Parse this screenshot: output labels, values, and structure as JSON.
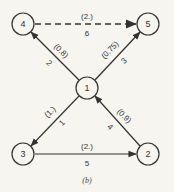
{
  "caption": "(b)",
  "nodes": [
    {
      "id": "1",
      "label": "1",
      "x": 87,
      "y": 88
    },
    {
      "id": "2",
      "label": "2",
      "x": 148,
      "y": 154
    },
    {
      "id": "3",
      "label": "3",
      "x": 23,
      "y": 154
    },
    {
      "id": "4",
      "label": "4",
      "x": 23,
      "y": 24
    },
    {
      "id": "5",
      "label": "5",
      "x": 148,
      "y": 24
    }
  ],
  "edges": [
    {
      "number": "1",
      "weight": "(1.)",
      "from": "1",
      "to": "3",
      "style": "solid"
    },
    {
      "number": "2",
      "weight": "(0.8)",
      "from": "1",
      "to": "4",
      "style": "solid"
    },
    {
      "number": "3",
      "weight": "(0.75)",
      "from": "1",
      "to": "5",
      "style": "solid"
    },
    {
      "number": "4",
      "weight": "(0.9)",
      "from": "2",
      "to": "1",
      "style": "solid"
    },
    {
      "number": "5",
      "weight": "(2.)",
      "from": "3",
      "to": "2",
      "style": "solid"
    },
    {
      "number": "6",
      "weight": "(2.)",
      "from": "4",
      "to": "5",
      "style": "dashed"
    }
  ]
}
